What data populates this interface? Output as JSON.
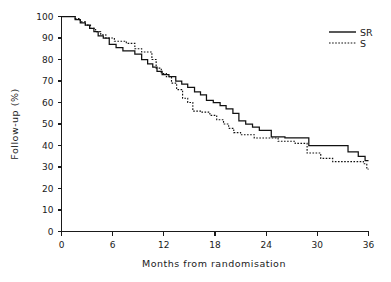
{
  "chart_data": {
    "type": "line",
    "title": "",
    "xlabel": "Months from randomisation",
    "ylabel": "Follow-up (%)",
    "xlim": [
      0,
      36
    ],
    "ylim": [
      0,
      100
    ],
    "xticks": [
      0,
      6,
      12,
      18,
      24,
      30,
      36
    ],
    "yticks": [
      0,
      10,
      20,
      30,
      40,
      50,
      60,
      70,
      80,
      90,
      100
    ],
    "grid": false,
    "legend_position": "top-right",
    "style": "kaplan-meier step curves",
    "series": [
      {
        "name": "SR",
        "linestyle": "solid",
        "color": "#111111",
        "points": [
          [
            0,
            100
          ],
          [
            1.6,
            100
          ],
          [
            1.6,
            98.5
          ],
          [
            2.2,
            98.5
          ],
          [
            2.2,
            97
          ],
          [
            2.8,
            97
          ],
          [
            2.8,
            96
          ],
          [
            3.3,
            96
          ],
          [
            3.3,
            94.5
          ],
          [
            3.8,
            94.5
          ],
          [
            3.8,
            93
          ],
          [
            4.3,
            93
          ],
          [
            4.3,
            91
          ],
          [
            4.9,
            91
          ],
          [
            4.9,
            90
          ],
          [
            5.6,
            90
          ],
          [
            5.6,
            87
          ],
          [
            6.4,
            87
          ],
          [
            6.4,
            85.5
          ],
          [
            7.2,
            85.5
          ],
          [
            7.2,
            84
          ],
          [
            8.6,
            84
          ],
          [
            8.6,
            82.5
          ],
          [
            9.4,
            82.5
          ],
          [
            9.4,
            80
          ],
          [
            10.1,
            80
          ],
          [
            10.1,
            78
          ],
          [
            10.7,
            78
          ],
          [
            10.7,
            76.5
          ],
          [
            11.2,
            76.5
          ],
          [
            11.2,
            74.5
          ],
          [
            11.8,
            74.5
          ],
          [
            11.8,
            73
          ],
          [
            12.6,
            73
          ],
          [
            12.6,
            72
          ],
          [
            13.4,
            72
          ],
          [
            13.4,
            70
          ],
          [
            14.1,
            70
          ],
          [
            14.1,
            68.5
          ],
          [
            14.8,
            68.5
          ],
          [
            14.8,
            67
          ],
          [
            15.6,
            67
          ],
          [
            15.6,
            65
          ],
          [
            16.3,
            65
          ],
          [
            16.3,
            63.5
          ],
          [
            17.0,
            63.5
          ],
          [
            17.0,
            61
          ],
          [
            17.8,
            61
          ],
          [
            17.8,
            60
          ],
          [
            18.6,
            60
          ],
          [
            18.6,
            58.5
          ],
          [
            19.3,
            58.5
          ],
          [
            19.3,
            57
          ],
          [
            20.1,
            57
          ],
          [
            20.1,
            55
          ],
          [
            20.8,
            55
          ],
          [
            20.8,
            51.5
          ],
          [
            21.6,
            51.5
          ],
          [
            21.6,
            50
          ],
          [
            22.4,
            50
          ],
          [
            22.4,
            48.5
          ],
          [
            23.2,
            48.5
          ],
          [
            23.2,
            47
          ],
          [
            24.6,
            47
          ],
          [
            24.6,
            44
          ],
          [
            26.2,
            44
          ],
          [
            26.2,
            43.5
          ],
          [
            29.0,
            43.5
          ],
          [
            29.0,
            40
          ],
          [
            33.6,
            40
          ],
          [
            33.6,
            37
          ],
          [
            34.8,
            37
          ],
          [
            34.8,
            35
          ],
          [
            35.6,
            35
          ],
          [
            35.6,
            33
          ],
          [
            36,
            33
          ]
        ]
      },
      {
        "name": "S",
        "linestyle": "dotted",
        "color": "#111111",
        "points": [
          [
            0,
            100
          ],
          [
            1.6,
            100
          ],
          [
            1.6,
            99
          ],
          [
            2.2,
            99
          ],
          [
            2.2,
            97.5
          ],
          [
            2.8,
            97.5
          ],
          [
            2.8,
            96
          ],
          [
            3.4,
            96
          ],
          [
            3.4,
            94.5
          ],
          [
            4.0,
            94.5
          ],
          [
            4.0,
            93
          ],
          [
            4.6,
            93
          ],
          [
            4.6,
            91.5
          ],
          [
            5.2,
            91.5
          ],
          [
            5.2,
            90
          ],
          [
            6.2,
            90
          ],
          [
            6.2,
            88.5
          ],
          [
            7.6,
            88.5
          ],
          [
            7.6,
            87.5
          ],
          [
            8.6,
            87.5
          ],
          [
            8.6,
            85
          ],
          [
            9.4,
            85
          ],
          [
            9.4,
            83.5
          ],
          [
            10.6,
            83.5
          ],
          [
            10.6,
            80
          ],
          [
            11.1,
            80
          ],
          [
            11.1,
            76
          ],
          [
            11.7,
            76
          ],
          [
            11.7,
            73.5
          ],
          [
            12.3,
            73.5
          ],
          [
            12.3,
            72
          ],
          [
            12.9,
            72
          ],
          [
            12.9,
            69
          ],
          [
            13.5,
            69
          ],
          [
            13.5,
            66
          ],
          [
            14.2,
            66
          ],
          [
            14.2,
            62
          ],
          [
            14.8,
            62
          ],
          [
            14.8,
            60
          ],
          [
            15.4,
            60
          ],
          [
            15.4,
            56
          ],
          [
            16.4,
            56
          ],
          [
            16.4,
            55.5
          ],
          [
            17.4,
            55.5
          ],
          [
            17.4,
            54
          ],
          [
            18.2,
            54
          ],
          [
            18.2,
            52
          ],
          [
            19.0,
            52
          ],
          [
            19.0,
            50
          ],
          [
            19.6,
            50
          ],
          [
            19.6,
            48
          ],
          [
            20.2,
            48
          ],
          [
            20.2,
            46
          ],
          [
            21.0,
            46
          ],
          [
            21.0,
            45
          ],
          [
            22.6,
            45
          ],
          [
            22.6,
            43.5
          ],
          [
            25.4,
            43.5
          ],
          [
            25.4,
            42
          ],
          [
            27.4,
            42
          ],
          [
            27.4,
            41
          ],
          [
            28.8,
            41
          ],
          [
            28.8,
            36.5
          ],
          [
            30.4,
            36.5
          ],
          [
            30.4,
            34
          ],
          [
            31.8,
            34
          ],
          [
            31.8,
            32.5
          ],
          [
            35.4,
            32.5
          ],
          [
            35.4,
            31.5
          ],
          [
            35.8,
            31.5
          ],
          [
            35.8,
            29
          ],
          [
            36,
            29
          ]
        ]
      }
    ],
    "legend": [
      {
        "label": "SR",
        "linestyle": "solid"
      },
      {
        "label": "S",
        "linestyle": "dotted"
      }
    ]
  },
  "axes": {
    "x_tick_labels": [
      "0",
      "6",
      "12",
      "18",
      "24",
      "30",
      "36"
    ],
    "y_tick_labels": [
      "0",
      "10",
      "20",
      "30",
      "40",
      "50",
      "60",
      "70",
      "80",
      "90",
      "100"
    ],
    "x_axis_title": "Months from randomisation",
    "y_axis_title": "Follow-up (%)"
  },
  "legend": {
    "entry_sr": "SR",
    "entry_s": "S"
  }
}
